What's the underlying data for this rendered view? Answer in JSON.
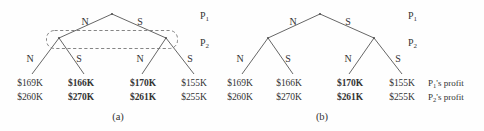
{
  "figure": {
    "background_color": "#fefefe",
    "line_color": "#555555",
    "text_color": "#333333",
    "dashed_box_color": "#777777"
  },
  "panels": [
    {
      "id": "a",
      "caption": "(a)",
      "has_information_set_box": true,
      "player_labels": [
        {
          "text": "P",
          "sub": "1"
        },
        {
          "text": "P",
          "sub": "2"
        }
      ],
      "root_branch_labels": [
        {
          "label": "N"
        },
        {
          "label": "S"
        }
      ],
      "subgame_branch_labels": [
        {
          "label": "N"
        },
        {
          "label": "S"
        },
        {
          "label": "N"
        },
        {
          "label": "S"
        }
      ],
      "leaves": [
        {
          "p1": "$169K",
          "p2": "$260K",
          "bold": false
        },
        {
          "p1": "$166K",
          "p2": "$270K",
          "bold": true
        },
        {
          "p1": "$170K",
          "p2": "$261K",
          "bold": true
        },
        {
          "p1": "$155K",
          "p2": "$255K",
          "bold": false
        }
      ]
    },
    {
      "id": "b",
      "caption": "(b)",
      "has_information_set_box": false,
      "player_labels": [
        {
          "text": "P",
          "sub": "1"
        },
        {
          "text": "P",
          "sub": "2"
        }
      ],
      "root_branch_labels": [
        {
          "label": "N"
        },
        {
          "label": "S"
        }
      ],
      "subgame_branch_labels": [
        {
          "label": "N"
        },
        {
          "label": "S"
        },
        {
          "label": "N"
        },
        {
          "label": "S"
        }
      ],
      "leaves": [
        {
          "p1": "$169K",
          "p2": "$260K",
          "bold": false
        },
        {
          "p1": "$166K",
          "p2": "$270K",
          "bold": false
        },
        {
          "p1": "$170K",
          "p2": "$261K",
          "bold": true
        },
        {
          "p1": "$155K",
          "p2": "$255K",
          "bold": false
        }
      ],
      "profit_notes": [
        {
          "text": "P",
          "sub": "1",
          "suffix": "'s profit"
        },
        {
          "text": "P",
          "sub": "2",
          "suffix": "'s profit"
        }
      ]
    }
  ]
}
